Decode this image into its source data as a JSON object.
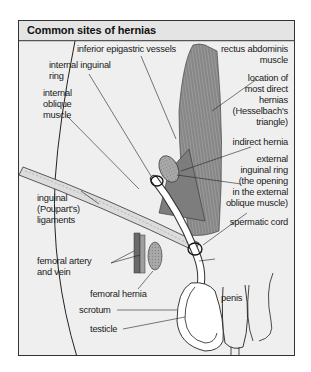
{
  "title": "Common sites of hernias",
  "labels": {
    "inferior_epigastric_vessels": "inferior epigastric vessels",
    "internal_inguinal_ring_1": "internal inguinal",
    "internal_inguinal_ring_2": "ring",
    "internal_oblique_1": "internal",
    "internal_oblique_2": "oblique",
    "internal_oblique_3": "muscle",
    "inguinal_ligaments_1": "inguinal",
    "inguinal_ligaments_2": "(Poupart's)",
    "inguinal_ligaments_3": "ligaments",
    "femoral_artery_1": "femoral artery",
    "femoral_artery_2": "and vein",
    "femoral_hernia": "femoral hernia",
    "scrotum": "scrotum",
    "testicle": "testicle",
    "rectus_1": "rectus abdominis",
    "rectus_2": "muscle",
    "direct_1": "location of",
    "direct_2": "most direct",
    "direct_3": "hernias",
    "direct_4": "(Hesselbach's",
    "direct_5": "triangle)",
    "indirect_hernia": "indirect hernia",
    "external_ring_1": "external",
    "external_ring_2": "inguinal ring",
    "external_ring_3": "(the opening",
    "external_ring_4": "in the external",
    "external_ring_5": "oblique muscle)",
    "spermatic_cord": "spermatic cord",
    "penis": "penis"
  },
  "colors": {
    "background": "#efefef",
    "title_bar": "#e4e4e4",
    "muscle": "#8a8a8a",
    "hernia": "#9a9a9a",
    "line": "#222222"
  }
}
